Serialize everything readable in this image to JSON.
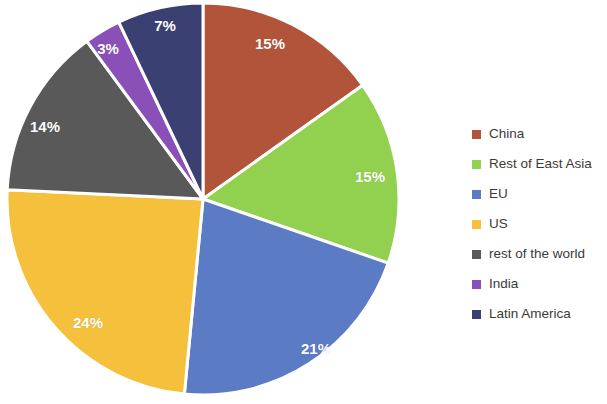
{
  "chart_data": {
    "type": "pie",
    "title": "",
    "subtitle": "",
    "xlabel": "",
    "ylabel": "",
    "legend_position": "right",
    "grid": false,
    "labels_inside_slices": true,
    "label_format": "percent",
    "categories": [
      "China",
      "Rest of East Asia",
      "EU",
      "US",
      "rest of the world",
      "India",
      "Latin America"
    ],
    "values": [
      15,
      15,
      21,
      24,
      14,
      3,
      7
    ],
    "value_labels": [
      "15%",
      "15%",
      "21%",
      "24%",
      "14%",
      "3%",
      "7%"
    ],
    "colors": [
      "#B1543A",
      "#92D050",
      "#5B7BC4",
      "#F5C13C",
      "#595959",
      "#8B4FB8",
      "#3B4073"
    ],
    "slices": [
      {
        "name": "China",
        "value": 15,
        "label": "15%",
        "color": "#B1543A",
        "label_x": 270,
        "label_y": 43
      },
      {
        "name": "Rest of East Asia",
        "value": 15,
        "label": "15%",
        "color": "#92D050",
        "label_x": 370,
        "label_y": 176
      },
      {
        "name": "EU",
        "value": 21,
        "label": "21%",
        "color": "#5B7BC4",
        "label_x": 316,
        "label_y": 348
      },
      {
        "name": "US",
        "value": 24,
        "label": "24%",
        "color": "#F5C13C",
        "label_x": 88,
        "label_y": 322
      },
      {
        "name": "rest of the world",
        "value": 14,
        "label": "14%",
        "color": "#595959",
        "label_x": 45,
        "label_y": 126
      },
      {
        "name": "India",
        "value": 3,
        "label": "3%",
        "color": "#8B4FB8",
        "label_x": 108,
        "label_y": 48
      },
      {
        "name": "Latin America",
        "value": 7,
        "label": "7%",
        "color": "#3B4073",
        "label_x": 165,
        "label_y": 25
      }
    ],
    "geometry": {
      "center_x": 203,
      "center_y": 199,
      "radius": 196,
      "start_angle_deg": 0,
      "direction": "clockwise",
      "separator_color": "#ffffff",
      "separator_width": 3
    }
  },
  "legend": {
    "items": [
      {
        "label": "China",
        "color": "#B1543A"
      },
      {
        "label": "Rest of East Asia",
        "color": "#92D050"
      },
      {
        "label": "EU",
        "color": "#5B7BC4"
      },
      {
        "label": "US",
        "color": "#F5C13C"
      },
      {
        "label": "rest of the world",
        "color": "#595959"
      },
      {
        "label": "India",
        "color": "#8B4FB8"
      },
      {
        "label": "Latin America",
        "color": "#3B4073"
      }
    ]
  },
  "background_color": "#ffffff"
}
